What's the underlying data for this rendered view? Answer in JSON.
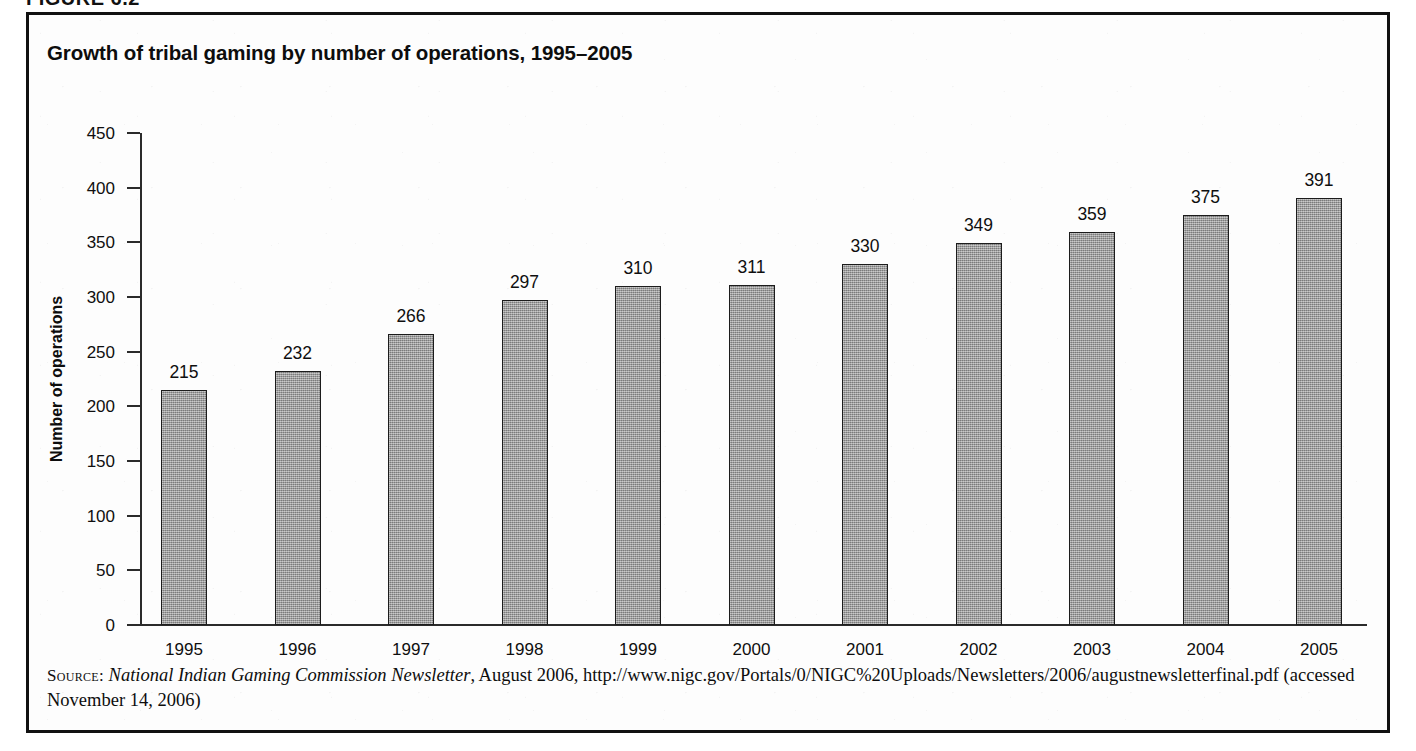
{
  "figure": {
    "number_label": "FIGURE 6.2",
    "title": "Growth of tribal gaming by number of operations, 1995–2005"
  },
  "chart_data": {
    "type": "bar",
    "title": "Growth of tribal gaming by number of operations, 1995–2005",
    "xlabel": "",
    "ylabel": "Number of operations",
    "categories": [
      "1995",
      "1996",
      "1997",
      "1998",
      "1999",
      "2000",
      "2001",
      "2002",
      "2003",
      "2004",
      "2005"
    ],
    "values": [
      215,
      232,
      266,
      297,
      310,
      311,
      330,
      349,
      359,
      375,
      391
    ],
    "ylim": [
      0,
      450
    ],
    "ytick_step": 50,
    "yticks": [
      0,
      50,
      100,
      150,
      200,
      250,
      300,
      350,
      400,
      450
    ],
    "ytick_labels": [
      "0",
      "50",
      "100",
      "150",
      "200",
      "250",
      "300",
      "350",
      "400",
      "450"
    ],
    "grid": false,
    "legend": false,
    "data_labels": true,
    "bar_color": "#9c9c9c",
    "bar_edge_color": "#1c1c1c",
    "axis_color": "#2b2b2b"
  },
  "source": {
    "label": "Source:",
    "publication": "National Indian Gaming Commission Newsletter",
    "date_text": ", August 2006, ",
    "url": "http://www.nigc.gov/Portals/0/NIGC%20Uploads/Newsletters/2006/augustnewsletterfinal.pdf",
    "accessed": " (accessed November 14, 2006)"
  }
}
